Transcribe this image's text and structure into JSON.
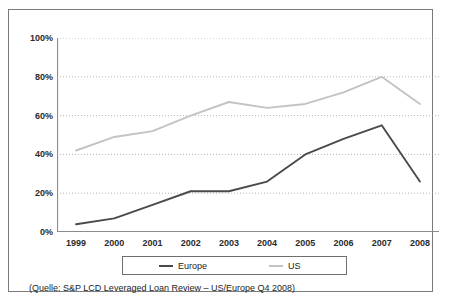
{
  "chart_data": {
    "type": "line",
    "title": "",
    "subtitle": "",
    "xlabel": "",
    "ylabel": "",
    "categories": [
      "1999",
      "2000",
      "2001",
      "2002",
      "2003",
      "2004",
      "2005",
      "2006",
      "2007",
      "2008"
    ],
    "series": [
      {
        "name": "Europe",
        "color": "#4a4a4a",
        "values": [
          4,
          7,
          14,
          21,
          21,
          26,
          40,
          48,
          55,
          26
        ]
      },
      {
        "name": "US",
        "color": "#c3c3c3",
        "values": [
          42,
          49,
          52,
          60,
          67,
          64,
          66,
          72,
          80,
          66
        ]
      }
    ],
    "ylim": [
      0,
      100
    ],
    "yticks": [
      0,
      20,
      40,
      60,
      80,
      100
    ],
    "ytick_labels": [
      "0%",
      "20%",
      "40%",
      "60%",
      "80%",
      "100%"
    ],
    "grid": true,
    "grid_style": "dotted-horizontal",
    "grid_color": "#a0a0a0",
    "axis_color": "#8c8c8c",
    "legend_position": "bottom"
  },
  "legend": {
    "entries": [
      {
        "label": "Europe",
        "color": "#4a4a4a"
      },
      {
        "label": "US",
        "color": "#c3c3c3"
      }
    ]
  },
  "caption": {
    "source_text": "(Quelle: S&P LCD Leveraged Loan Review – US/Europe Q4 2008)"
  },
  "colors": {
    "frame_border": "#7b7b7b",
    "background": "#ffffff",
    "text": "#1c1c1c"
  }
}
